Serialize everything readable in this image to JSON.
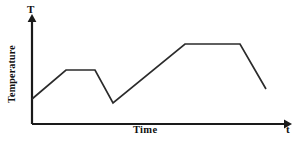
{
  "chart_data": {
    "type": "line",
    "title": "",
    "xlabel": "Time",
    "ylabel": "Temperature",
    "x_axis_symbol": "t",
    "y_axis_symbol": "T",
    "grid": false,
    "legend": false,
    "axes_have_arrows": true,
    "tick_labels": {
      "x": [],
      "y": []
    },
    "xlim": [
      0,
      100
    ],
    "ylim": [
      0,
      100
    ],
    "series": [
      {
        "name": "Temperature profile",
        "color": "#2b2b2b",
        "x": [
          0,
          14.5,
          26.9,
          34.6,
          65.4,
          88.9,
          100.0
        ],
        "y": [
          31.6,
          67.1,
          67.1,
          26.6,
          96.2,
          96.2,
          41.8
        ],
        "segments": [
          {
            "label": "initial heating ramp",
            "from_point": 0,
            "to_point": 1,
            "shape": "rising-line"
          },
          {
            "label": "first plateau",
            "from_point": 1,
            "to_point": 2,
            "shape": "flat-line"
          },
          {
            "label": "cooling drop",
            "from_point": 2,
            "to_point": 3,
            "shape": "falling-line"
          },
          {
            "label": "main heating ramp",
            "from_point": 3,
            "to_point": 4,
            "shape": "rising-line"
          },
          {
            "label": "second plateau",
            "from_point": 4,
            "to_point": 5,
            "shape": "flat-line"
          },
          {
            "label": "final cooling",
            "from_point": 5,
            "to_point": 6,
            "shape": "falling-line"
          }
        ]
      }
    ],
    "pixel_vertices": [
      [
        32,
        99
      ],
      [
        66,
        70
      ],
      [
        95,
        70
      ],
      [
        113,
        103
      ],
      [
        185,
        44
      ],
      [
        240,
        44
      ],
      [
        266,
        89
      ]
    ],
    "colors": {
      "curve": "#2b2b2b",
      "axis": "#1a1a1a",
      "text": "#111111",
      "background": "#ffffff"
    }
  },
  "figure": {
    "y_axis_symbol": "T",
    "x_axis_symbol": "t",
    "x_axis_title": "Time",
    "y_axis_title": "Temperature"
  }
}
